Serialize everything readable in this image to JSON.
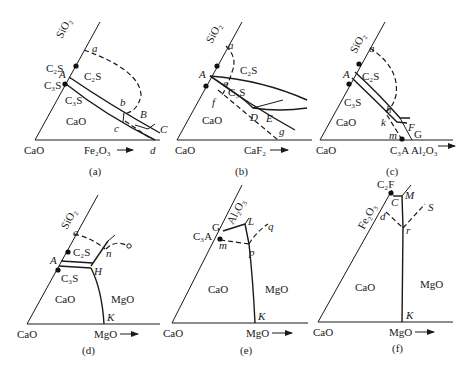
{
  "figure": {
    "panels": [
      {
        "id": "a",
        "caption": "(a)",
        "axes": {
          "origin": "CaO",
          "side_axis": "SiO2",
          "bottom_axis": "Fe2O3"
        },
        "regions": [
          "C2S",
          "C3S",
          "CaO"
        ],
        "compounds": [
          "C2S",
          "C3S"
        ],
        "points": [
          "a",
          "A",
          "b",
          "c",
          "B",
          "C",
          "d"
        ]
      },
      {
        "id": "b",
        "caption": "(b)",
        "axes": {
          "origin": "CaO",
          "side_axis": "SiO2",
          "bottom_axis": "CaF2"
        },
        "regions": [
          "C2S",
          "C3S",
          "CaO"
        ],
        "points": [
          "a",
          "A",
          "e",
          "f",
          "D",
          "E",
          "g"
        ]
      },
      {
        "id": "c",
        "caption": "(c)",
        "axes": {
          "origin": "CaO",
          "side_axis": "SiO2",
          "bottom_axis": "Al2O3"
        },
        "regions": [
          "C2S",
          "C3S",
          "CaO"
        ],
        "compounds": [
          "C3A"
        ],
        "points": [
          "a",
          "A",
          "h",
          "k",
          "m",
          "F",
          "G"
        ]
      },
      {
        "id": "d",
        "caption": "(d)",
        "axes": {
          "origin": "CaO",
          "side_axis": "SiO2",
          "bottom_axis": "MgO"
        },
        "regions": [
          "C2S",
          "C3S",
          "CaO",
          "MgO"
        ],
        "points": [
          "a",
          "A",
          "n",
          "H",
          "K"
        ]
      },
      {
        "id": "e",
        "caption": "(e)",
        "axes": {
          "origin": "CaO",
          "side_axis": "Al2O3",
          "bottom_axis": "MgO"
        },
        "regions": [
          "CaO",
          "MgO"
        ],
        "compounds": [
          "C3A"
        ],
        "points": [
          "G",
          "L",
          "q",
          "m",
          "p",
          "K"
        ]
      },
      {
        "id": "f",
        "caption": "(f)",
        "axes": {
          "origin": "CaO",
          "side_axis": "Fe2O3",
          "bottom_axis": "MgO"
        },
        "regions": [
          "CaO",
          "MgO"
        ],
        "compounds": [
          "C2F"
        ],
        "points": [
          "C",
          "M",
          "S",
          "d",
          "r",
          "K"
        ]
      }
    ]
  },
  "labels": {
    "CaO": "CaO",
    "MgO": "MgO",
    "C2S": "C₂S",
    "C3S": "C₃S",
    "C3A": "C₃A",
    "C2F": "C₂F",
    "SiO2": "SiO₂",
    "Al2O3": "Al₂O₃",
    "Fe2O3": "Fe₂O₃",
    "CaF2": "CaF₂",
    "arrow": "→"
  },
  "captions": {
    "a": "(a)",
    "b": "(b)",
    "c": "(c)",
    "d": "(d)",
    "e": "(e)",
    "f": "(f)"
  },
  "points": {
    "a": "a",
    "A": "A",
    "b": "b",
    "B": "B",
    "c": "c",
    "C": "C",
    "d": "d",
    "D": "D",
    "e": "e",
    "E": "E",
    "f": "f",
    "F": "F",
    "g": "g",
    "G": "G",
    "h": "h",
    "H": "H",
    "k": "k",
    "K": "K",
    "L": "L",
    "m": "m",
    "M": "M",
    "n": "n",
    "p": "p",
    "q": "q",
    "r": "r",
    "S": "S"
  }
}
